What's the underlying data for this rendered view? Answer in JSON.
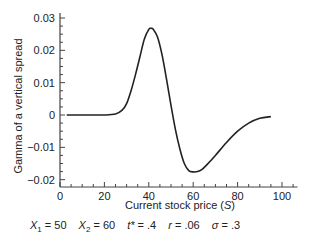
{
  "chart_data": {
    "type": "line",
    "title": "",
    "xlabel": "Current stock price (S)",
    "ylabel": "Gamma of a vertical spread",
    "xlim": [
      0,
      107
    ],
    "ylim": [
      -0.022,
      0.032
    ],
    "x_ticks": [
      0,
      20,
      40,
      60,
      80,
      100
    ],
    "x_tick_labels": [
      "0",
      "20",
      "40",
      "60",
      "80",
      "100"
    ],
    "y_ticks": [
      -0.02,
      -0.01,
      0,
      0.01,
      0.02,
      0.03
    ],
    "y_tick_labels": [
      "−0.02",
      "−0.01",
      "0",
      "0.01",
      "0.02",
      "0.03"
    ],
    "grid": false,
    "legend": false,
    "series": [
      {
        "name": "Gamma",
        "x": [
          3,
          10,
          20,
          25,
          28,
          30,
          32,
          34,
          36,
          38,
          40,
          41,
          42,
          44,
          46,
          48,
          50,
          52,
          54,
          56,
          58,
          60,
          62,
          64,
          66,
          70,
          75,
          80,
          85,
          90,
          95
        ],
        "y": [
          0,
          0,
          0,
          0.0003,
          0.0015,
          0.0035,
          0.0075,
          0.0125,
          0.018,
          0.0235,
          0.0265,
          0.0268,
          0.0265,
          0.024,
          0.0185,
          0.011,
          0.003,
          -0.0045,
          -0.0105,
          -0.015,
          -0.0172,
          -0.0176,
          -0.0175,
          -0.0168,
          -0.0155,
          -0.0125,
          -0.0085,
          -0.005,
          -0.0025,
          -0.001,
          -0.0005
        ]
      }
    ],
    "annotations": [
      {
        "label": "X1",
        "value": "50"
      },
      {
        "label": "X2",
        "value": "60"
      },
      {
        "label": "t*",
        "value": ".4"
      },
      {
        "label": "r",
        "value": ".06"
      },
      {
        "label": "σ",
        "value": ".3"
      }
    ]
  },
  "labels": {
    "xlabel_text": "Current stock price (",
    "xlabel_var": "S",
    "xlabel_close": ")",
    "ylabel": "Gamma of a vertical spread"
  },
  "params": [
    {
      "var": "X",
      "sub": "1",
      "eq": " = 50"
    },
    {
      "var": "X",
      "sub": "2",
      "eq": " = 60"
    },
    {
      "var": "t*",
      "sub": "",
      "eq": " = .4"
    },
    {
      "var": "r",
      "sub": "",
      "eq": " = .06"
    },
    {
      "var": "σ",
      "sub": "",
      "eq": " = .3"
    }
  ]
}
